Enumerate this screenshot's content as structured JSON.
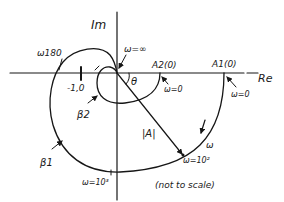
{
  "diagram": {
    "type": "nyquist-plot-sketch",
    "axes": {
      "imaginary_label": "Im",
      "real_label": "Re"
    },
    "points": {
      "critical_point": "-1,0",
      "A1": "A1(0)",
      "A2": "A2(0)"
    },
    "frequency_labels": {
      "omega_infinity": "ω=∞",
      "omega_zero_A2": "ω=0",
      "omega_zero_A1": "ω=0",
      "omega_180": "ω180",
      "omega_1e2": "ω=10²",
      "omega_1e3": "ω=10³",
      "omega_direction": "ω"
    },
    "curves": {
      "outer": "β1",
      "inner": "β2"
    },
    "vector": {
      "magnitude": "|A|",
      "angle": "θ"
    },
    "note": "(not to scale)"
  },
  "colors": {
    "ink": "#161616",
    "background": "#ffffff"
  }
}
